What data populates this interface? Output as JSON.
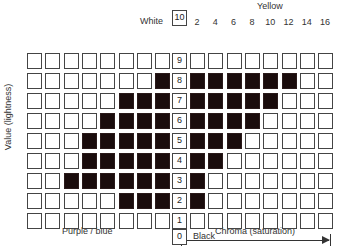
{
  "labels": {
    "white": "White",
    "black": "Black",
    "yellow": "Yellow",
    "purple_blue": "Purple / blue",
    "y_axis": "Value (lightness)",
    "chroma_axis": "Chroma (saturation)"
  },
  "value_scale": [
    "10",
    "9",
    "8",
    "7",
    "6",
    "5",
    "4",
    "3",
    "2",
    "1",
    "0"
  ],
  "left_ticks": [
    "16",
    "14",
    "12",
    "10",
    "8",
    "6",
    "4",
    "2"
  ],
  "right_ticks": [
    "2",
    "4",
    "6",
    "8",
    "10",
    "12",
    "14",
    "16"
  ],
  "grid": {
    "rows_value_top_to_bottom": [
      9,
      8,
      7,
      6,
      5,
      4,
      3,
      2,
      1
    ],
    "left_filled_counts": [
      0,
      1,
      3,
      4,
      5,
      5,
      6,
      3,
      0
    ],
    "right_filled_counts": [
      0,
      6,
      5,
      4,
      3,
      2,
      1,
      1,
      0
    ],
    "fill_color": "#1a0c0c",
    "empty_color": "#ffffff"
  }
}
